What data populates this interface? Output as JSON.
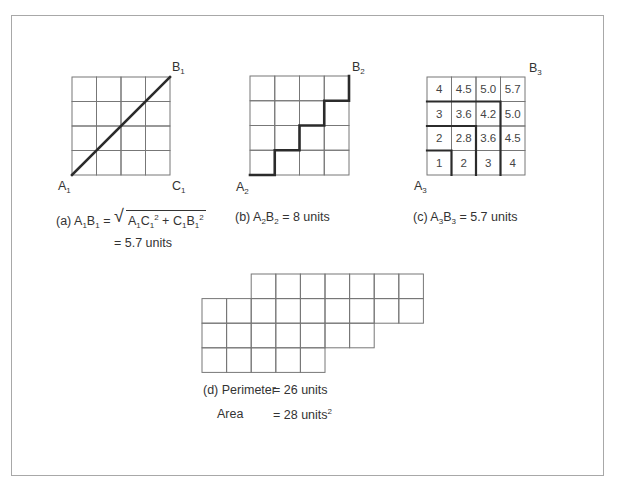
{
  "figure_a": {
    "grid_size": 4,
    "labels": {
      "start": "A",
      "start_sub": "1",
      "end": "B",
      "end_sub": "1",
      "corner": "C",
      "corner_sub": "1"
    },
    "caption": {
      "prefix": "(a) ",
      "lhs_a": "A",
      "lhs_a_sub": "1",
      "lhs_b": "B",
      "lhs_b_sub": "1",
      "eq": " = ",
      "term1_a": "A",
      "term1_a_sub": "1",
      "term1_b": "C",
      "term1_b_sub": "1",
      "term1_pow": "2",
      "plus": " + ",
      "term2_a": "C",
      "term2_a_sub": "1",
      "term2_b": "B",
      "term2_b_sub": "1",
      "term2_pow": "2",
      "result": "= 5.7 units"
    },
    "path": "diagonal"
  },
  "figure_b": {
    "grid_size": 4,
    "labels": {
      "start": "A",
      "start_sub": "2",
      "end": "B",
      "end_sub": "2"
    },
    "caption": {
      "prefix": "(b) ",
      "a": "A",
      "a_sub": "2",
      "b": "B",
      "b_sub": "2",
      "rest": " = 8 units"
    },
    "path": "staircase"
  },
  "figure_c": {
    "grid_size": 4,
    "labels": {
      "start": "A",
      "start_sub": "3",
      "end": "B",
      "end_sub": "3"
    },
    "cells": [
      [
        "4",
        "4.5",
        "5.0",
        "5.7"
      ],
      [
        "3",
        "3.6",
        "4.2",
        "5.0"
      ],
      [
        "2",
        "2.8",
        "3.6",
        "4.5"
      ],
      [
        "1",
        "2",
        "3",
        "4"
      ]
    ],
    "caption": {
      "prefix": "(c) ",
      "a": "A",
      "a_sub": "3",
      "b": "B",
      "b_sub": "3",
      "rest": " = 5.7 units"
    }
  },
  "figure_d": {
    "rows": [
      {
        "start_col": 2,
        "end_col": 8
      },
      {
        "start_col": 0,
        "end_col": 8
      },
      {
        "start_col": 0,
        "end_col": 6
      },
      {
        "start_col": 0,
        "end_col": 4
      }
    ],
    "caption": {
      "perimeter_label": "(d) Perimeter",
      "perimeter_value": "= 26 units",
      "area_label": "Area",
      "area_value": "= 28 units",
      "area_pow": "2"
    }
  }
}
